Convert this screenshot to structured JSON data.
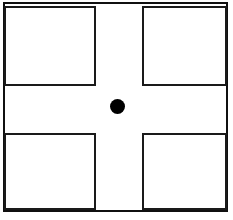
{
  "figure": {
    "canvas": {
      "width_px": 233,
      "height_px": 220,
      "background_color": "#ffffff"
    },
    "frame": {
      "label": "outer frame",
      "stroke_color": "#101010",
      "stroke_width_px": 2,
      "x_px": 3,
      "y_px": 2,
      "width_px": 225,
      "height_px": 210
    },
    "gap": {
      "label": "cross-shaped white gap",
      "color": "#ffffff",
      "vertical_band_x_px": 96,
      "vertical_band_width_px": 46,
      "horizontal_band_y_px": 86,
      "horizontal_band_height_px": 47
    },
    "quadrants": [
      {
        "name": "top-left",
        "label": "Top-left square",
        "fill_color": "#ffffff",
        "stroke_color": "#1a1a1a",
        "stroke_width_px": 2,
        "x_px": 4,
        "y_px": 6,
        "width_px": 92,
        "height_px": 80
      },
      {
        "name": "top-right",
        "label": "Top-right square",
        "fill_color": "#ffffff",
        "stroke_color": "#1a1a1a",
        "stroke_width_px": 2,
        "x_px": 142,
        "y_px": 6,
        "width_px": 85,
        "height_px": 80
      },
      {
        "name": "bottom-left",
        "label": "Bottom-left square",
        "fill_color": "#ffffff",
        "stroke_color": "#1a1a1a",
        "stroke_width_px": 2,
        "x_px": 4,
        "y_px": 133,
        "width_px": 92,
        "height_px": 77
      },
      {
        "name": "bottom-right",
        "label": "Bottom-right square",
        "fill_color": "#ffffff",
        "stroke_color": "#1a1a1a",
        "stroke_width_px": 2,
        "x_px": 142,
        "y_px": 133,
        "width_px": 85,
        "height_px": 77
      }
    ],
    "center_dot": {
      "label": "Center dot",
      "fill_color": "#000000",
      "center_x_px": 117,
      "center_y_px": 106,
      "diameter_px": 15
    }
  }
}
